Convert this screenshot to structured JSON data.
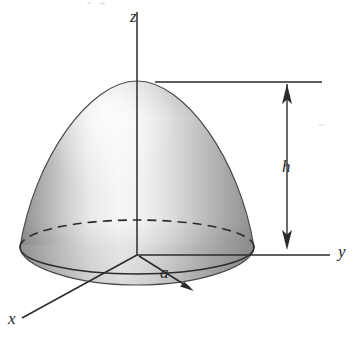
{
  "figure": {
    "type": "3d-solid-diagram",
    "background_color": "#ffffff",
    "line_color": "#2b2b2b",
    "surface_light_color": "#f2f2f2",
    "surface_mid_color": "#c3c3c3",
    "surface_dark_color": "#8f8f8f",
    "axes": {
      "z_label": "z",
      "y_label": "y",
      "x_label": "x"
    },
    "dimensions": {
      "height_label": "h",
      "radius_label": "a"
    },
    "geometry": {
      "origin": [
        137,
        255
      ],
      "apex": [
        137,
        81
      ],
      "base_radius_x": 117,
      "base_radius_y": 27,
      "base_center": [
        137,
        247
      ],
      "height_line_x": 287,
      "height_line_top_y": 82,
      "height_line_bottom_y": 248,
      "z_axis_top_y": 12,
      "y_axis_right_x": 330,
      "x_axis_end": [
        22,
        318
      ]
    }
  }
}
